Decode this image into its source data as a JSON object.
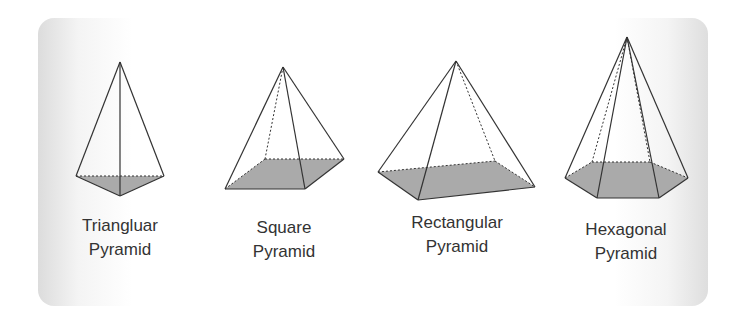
{
  "colors": {
    "base_fill": "#aaaaaa",
    "edge": "#333333",
    "text": "#333333",
    "card_edge": "#dcdcdc"
  },
  "pyramids": [
    {
      "name": "triangular",
      "label_line1": "Triangluar",
      "label_line2": "Pyramid",
      "apex": [
        120,
        62
      ],
      "base": [
        [
          76,
          176
        ],
        [
          120,
          196
        ],
        [
          164,
          176
        ]
      ],
      "solid_edges": [
        [
          [
            120,
            62
          ],
          [
            76,
            176
          ]
        ],
        [
          [
            120,
            62
          ],
          [
            164,
            176
          ]
        ],
        [
          [
            120,
            62
          ],
          [
            120,
            196
          ]
        ],
        [
          [
            76,
            176
          ],
          [
            120,
            196
          ]
        ],
        [
          [
            120,
            196
          ],
          [
            164,
            176
          ]
        ]
      ],
      "dashed_edges": [
        [
          [
            76,
            176
          ],
          [
            164,
            176
          ]
        ]
      ]
    },
    {
      "name": "square",
      "label_line1": "Square",
      "label_line2": "Pyramid",
      "apex": [
        283,
        67
      ],
      "base": [
        [
          225,
          189
        ],
        [
          305,
          189
        ],
        [
          344,
          159
        ],
        [
          265,
          159
        ]
      ],
      "solid_edges": [
        [
          [
            283,
            67
          ],
          [
            225,
            189
          ]
        ],
        [
          [
            283,
            67
          ],
          [
            305,
            189
          ]
        ],
        [
          [
            283,
            67
          ],
          [
            344,
            159
          ]
        ],
        [
          [
            225,
            189
          ],
          [
            305,
            189
          ]
        ],
        [
          [
            305,
            189
          ],
          [
            344,
            159
          ]
        ]
      ],
      "dashed_edges": [
        [
          [
            283,
            67
          ],
          [
            265,
            159
          ]
        ],
        [
          [
            225,
            189
          ],
          [
            265,
            159
          ]
        ],
        [
          [
            265,
            159
          ],
          [
            344,
            159
          ]
        ]
      ]
    },
    {
      "name": "rectangular",
      "label_line1": "Rectangular",
      "label_line2": "Pyramid",
      "apex": [
        456,
        61
      ],
      "base": [
        [
          378,
          172
        ],
        [
          418,
          200
        ],
        [
          535,
          187
        ],
        [
          495,
          161
        ]
      ],
      "solid_edges": [
        [
          [
            456,
            61
          ],
          [
            378,
            172
          ]
        ],
        [
          [
            456,
            61
          ],
          [
            418,
            200
          ]
        ],
        [
          [
            456,
            61
          ],
          [
            535,
            187
          ]
        ],
        [
          [
            378,
            172
          ],
          [
            418,
            200
          ]
        ],
        [
          [
            418,
            200
          ],
          [
            535,
            187
          ]
        ]
      ],
      "dashed_edges": [
        [
          [
            456,
            61
          ],
          [
            495,
            161
          ]
        ],
        [
          [
            378,
            172
          ],
          [
            495,
            161
          ]
        ],
        [
          [
            495,
            161
          ],
          [
            535,
            187
          ]
        ]
      ]
    },
    {
      "name": "hexagonal",
      "label_line1": "Hexagonal",
      "label_line2": "Pyramid",
      "apex": [
        627,
        37
      ],
      "base": [
        [
          565,
          178
        ],
        [
          597,
          198
        ],
        [
          659,
          198
        ],
        [
          688,
          178
        ],
        [
          650,
          162
        ],
        [
          592,
          162
        ]
      ],
      "solid_edges": [
        [
          [
            627,
            37
          ],
          [
            565,
            178
          ]
        ],
        [
          [
            627,
            37
          ],
          [
            597,
            198
          ]
        ],
        [
          [
            627,
            37
          ],
          [
            659,
            198
          ]
        ],
        [
          [
            627,
            37
          ],
          [
            688,
            178
          ]
        ],
        [
          [
            565,
            178
          ],
          [
            597,
            198
          ]
        ],
        [
          [
            597,
            198
          ],
          [
            659,
            198
          ]
        ],
        [
          [
            659,
            198
          ],
          [
            688,
            178
          ]
        ]
      ],
      "dashed_edges": [
        [
          [
            627,
            37
          ],
          [
            592,
            162
          ]
        ],
        [
          [
            627,
            37
          ],
          [
            650,
            162
          ]
        ],
        [
          [
            565,
            178
          ],
          [
            592,
            162
          ]
        ],
        [
          [
            592,
            162
          ],
          [
            650,
            162
          ]
        ],
        [
          [
            650,
            162
          ],
          [
            688,
            178
          ]
        ]
      ]
    }
  ]
}
